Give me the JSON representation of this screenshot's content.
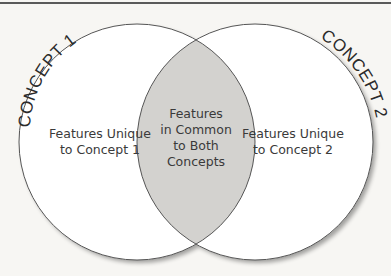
{
  "diagram": {
    "type": "venn",
    "colors": {
      "background": "#f7f6f3",
      "circle_fill": "#ffffff",
      "overlap_fill": "#d3d2cf",
      "stroke": "#555555",
      "text": "#3a3a3a"
    },
    "concept_1": {
      "title": "CONCEPT 1",
      "label": "Features Unique\nto Concept 1"
    },
    "concept_2": {
      "title": "CONCEPT 2",
      "label": "Features Unique\nto Concept 2"
    },
    "overlap": {
      "label": "Features\nin Common\nto Both\nConcepts"
    }
  }
}
